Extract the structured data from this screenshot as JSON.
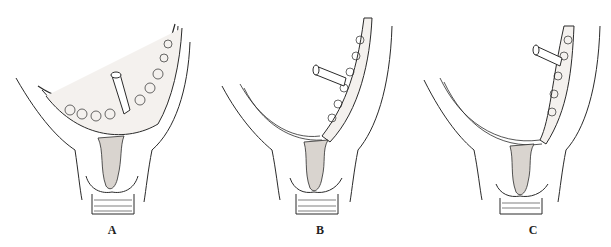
{
  "figure": {
    "panels": [
      {
        "id": "A",
        "label": "A",
        "label_x": 112,
        "label_y": 223
      },
      {
        "id": "B",
        "label": "B",
        "label_x": 320,
        "label_y": 223
      },
      {
        "id": "C",
        "label": "C",
        "label_x": 533,
        "label_y": 223
      }
    ],
    "colors": {
      "line": "#2a2a2a",
      "fill_stippled": "#f4f1ee",
      "fill_dense": "#d9d4cf",
      "background": "#ffffff"
    }
  }
}
